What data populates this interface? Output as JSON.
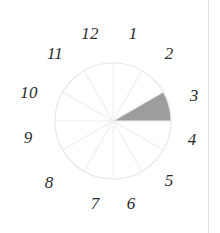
{
  "figure": {
    "kind": "clock-dial-sector-diagram",
    "background_color": "#ffffff",
    "width": 220,
    "height": 233,
    "page_edge_rule_color": "#e2e2e2"
  },
  "dial": {
    "center_x": 113,
    "center_y": 121,
    "radius": 58,
    "outline_color": "#e8e8e8",
    "spoke_color": "#eeeeee",
    "sector_count": 12
  },
  "shaded_sector": {
    "fill_color": "#9d9d9d",
    "from_hour": "2",
    "to_hour": "3",
    "start_angle_deg": 60,
    "end_angle_deg": 90
  },
  "hour_labels": [
    {
      "text": "12",
      "x": 90,
      "y": 33
    },
    {
      "text": "1",
      "x": 133,
      "y": 33
    },
    {
      "text": "11",
      "x": 55,
      "y": 53
    },
    {
      "text": "2",
      "x": 169,
      "y": 53
    },
    {
      "text": "10",
      "x": 29,
      "y": 92
    },
    {
      "text": "3",
      "x": 194,
      "y": 95
    },
    {
      "text": "9",
      "x": 28,
      "y": 137
    },
    {
      "text": "4",
      "x": 192,
      "y": 139
    },
    {
      "text": "8",
      "x": 49,
      "y": 182
    },
    {
      "text": "5",
      "x": 169,
      "y": 180
    },
    {
      "text": "7",
      "x": 95,
      "y": 203
    },
    {
      "text": "6",
      "x": 131,
      "y": 203
    }
  ],
  "chart_data": {
    "type": "pie",
    "title": "",
    "xlabel": "",
    "ylabel": "",
    "legend_position": "none",
    "grid": true,
    "categories": [
      "12",
      "1",
      "2",
      "3",
      "4",
      "5",
      "6",
      "7",
      "8",
      "9",
      "10",
      "11"
    ],
    "slice_degrees": [
      30,
      30,
      30,
      30,
      30,
      30,
      30,
      30,
      30,
      30,
      30,
      30
    ],
    "values": [
      0,
      0,
      1,
      0,
      0,
      0,
      0,
      0,
      0,
      0,
      0,
      0
    ],
    "highlighted_categories": [
      "2"
    ],
    "highlight_color": "#9d9d9d",
    "unfilled_color": "#ffffff",
    "tick_labels": [
      "1",
      "2",
      "3",
      "4",
      "5",
      "6",
      "7",
      "8",
      "9",
      "10",
      "11",
      "12"
    ],
    "annotations": []
  }
}
